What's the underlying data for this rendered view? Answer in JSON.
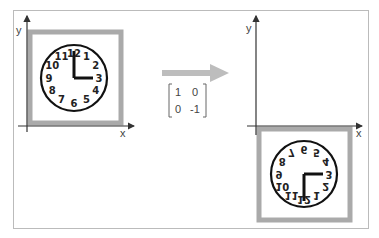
{
  "diagram": {
    "left_panel": {
      "axis_labels": {
        "x": "x",
        "y": "y"
      },
      "clock": {
        "numbers": [
          "12",
          "1",
          "2",
          "3",
          "4",
          "5",
          "6",
          "7",
          "8",
          "9",
          "10",
          "11"
        ],
        "time_shown": "3:00"
      }
    },
    "transform": {
      "matrix": [
        [
          "1",
          "0"
        ],
        [
          "0",
          "-1"
        ]
      ],
      "arrow": "right"
    },
    "right_panel": {
      "axis_labels": {
        "x": "x",
        "y": "y"
      },
      "clock": {
        "numbers": [
          "12",
          "1",
          "2",
          "3",
          "4",
          "5",
          "6",
          "7",
          "8",
          "9",
          "10",
          "11"
        ],
        "mirrored_vertically": true
      }
    },
    "colors": {
      "frame_border": "#bbbbbb",
      "clock_frame": "#aaaaaa",
      "arrow": "#bdbdbd",
      "axes": "#333333",
      "clock_ink": "#111111"
    }
  }
}
